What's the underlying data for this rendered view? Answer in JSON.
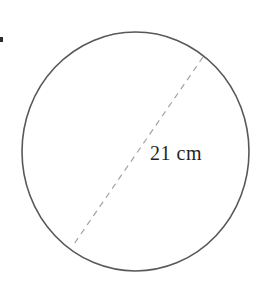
{
  "figure": {
    "kind": "circle-with-diameter",
    "background_color": "#ffffff",
    "bullet_marker": {
      "name": "list-bullet-marker",
      "color": "#2b2b2f",
      "cropped": true
    },
    "circle": {
      "name": "circle-outline",
      "stroke_color": "#55595c",
      "fill": "none",
      "stroke_width": 1.6,
      "center_x": 135.5,
      "center_y": 151.5,
      "radius_x": 113.5,
      "radius_y": 119.5
    },
    "diameter": {
      "name": "diameter-dashed-line",
      "stroke_color": "#a0a2a6",
      "stroke_width": 1.2,
      "dash_pattern": "6 5",
      "x1": 203,
      "y1": 57,
      "x2": 74,
      "y2": 244
    },
    "label": {
      "name": "diameter-measurement-label",
      "text": "21 cm",
      "value": 21,
      "unit": "cm",
      "color": "#1f1f23",
      "x": 150,
      "y": 142
    }
  }
}
